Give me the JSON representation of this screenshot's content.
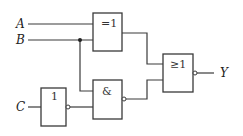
{
  "diagram": {
    "type": "logic-circuit",
    "inputs": [
      {
        "label": "A"
      },
      {
        "label": "B"
      },
      {
        "label": "C"
      }
    ],
    "output": {
      "label": "Y"
    },
    "gates": {
      "xor": {
        "symbol": "=1",
        "kind": "XOR",
        "inputs": [
          "A",
          "B"
        ]
      },
      "not": {
        "symbol": "1",
        "kind": "NOT",
        "inputs": [
          "C"
        ],
        "inverted_output": true
      },
      "nand": {
        "symbol": "&",
        "kind": "NAND",
        "inputs": [
          "B",
          "NOT C"
        ],
        "inverted_output": true
      },
      "nor": {
        "symbol": "≥1",
        "kind": "NOR",
        "inputs": [
          "XOR out",
          "NAND out"
        ],
        "inverted_output": true
      }
    },
    "colors": {
      "line": "#3a3a3a",
      "background": "#ffffff"
    }
  }
}
